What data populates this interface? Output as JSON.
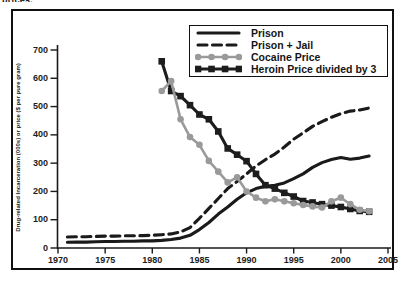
{
  "page": {
    "caption_fragment": "prices."
  },
  "chart_data": {
    "type": "line",
    "title": "",
    "xlabel": "",
    "ylabel": "Drug-related Incarceration (000s) or price ($ per pure gram)",
    "xlim": [
      1970,
      2005
    ],
    "ylim": [
      0,
      700
    ],
    "x_ticks": [
      1970,
      1975,
      1980,
      1985,
      1990,
      1995,
      2000,
      2005
    ],
    "y_ticks": [
      0,
      100,
      200,
      300,
      400,
      500,
      600,
      700
    ],
    "grid": false,
    "legend_position": "top-right",
    "axis_color": "#1a1a1a",
    "series": [
      {
        "name": "Prison",
        "style": "solid",
        "marker": "none",
        "color": "#1a1a1a",
        "points": [
          [
            1971,
            20
          ],
          [
            1972,
            21
          ],
          [
            1973,
            21
          ],
          [
            1974,
            22
          ],
          [
            1975,
            23
          ],
          [
            1976,
            23
          ],
          [
            1977,
            24
          ],
          [
            1978,
            24
          ],
          [
            1979,
            25
          ],
          [
            1980,
            25
          ],
          [
            1981,
            27
          ],
          [
            1982,
            30
          ],
          [
            1983,
            35
          ],
          [
            1984,
            45
          ],
          [
            1985,
            65
          ],
          [
            1986,
            90
          ],
          [
            1987,
            120
          ],
          [
            1988,
            145
          ],
          [
            1989,
            172
          ],
          [
            1990,
            195
          ],
          [
            1991,
            210
          ],
          [
            1992,
            218
          ],
          [
            1993,
            222
          ],
          [
            1994,
            230
          ],
          [
            1995,
            245
          ],
          [
            1996,
            262
          ],
          [
            1997,
            285
          ],
          [
            1998,
            302
          ],
          [
            1999,
            313
          ],
          [
            2000,
            320
          ],
          [
            2001,
            314
          ],
          [
            2002,
            318
          ],
          [
            2003,
            325
          ]
        ]
      },
      {
        "name": "Prison + Jail",
        "style": "dashed",
        "marker": "none",
        "color": "#1a1a1a",
        "points": [
          [
            1971,
            39
          ],
          [
            1972,
            40
          ],
          [
            1973,
            40
          ],
          [
            1974,
            41
          ],
          [
            1975,
            42
          ],
          [
            1976,
            42
          ],
          [
            1977,
            43
          ],
          [
            1978,
            43
          ],
          [
            1979,
            44
          ],
          [
            1980,
            45
          ],
          [
            1981,
            47
          ],
          [
            1982,
            50
          ],
          [
            1983,
            57
          ],
          [
            1984,
            72
          ],
          [
            1985,
            105
          ],
          [
            1986,
            140
          ],
          [
            1987,
            175
          ],
          [
            1988,
            210
          ],
          [
            1989,
            235
          ],
          [
            1990,
            262
          ],
          [
            1991,
            290
          ],
          [
            1992,
            312
          ],
          [
            1993,
            332
          ],
          [
            1994,
            357
          ],
          [
            1995,
            385
          ],
          [
            1996,
            407
          ],
          [
            1997,
            430
          ],
          [
            1998,
            447
          ],
          [
            1999,
            462
          ],
          [
            2000,
            475
          ],
          [
            2001,
            484
          ],
          [
            2002,
            488
          ],
          [
            2003,
            495
          ]
        ]
      },
      {
        "name": "Cocaine Price",
        "style": "solid",
        "marker": "circle",
        "color": "#9a9a9a",
        "points": [
          [
            1981,
            555
          ],
          [
            1982,
            590
          ],
          [
            1983,
            455
          ],
          [
            1984,
            392
          ],
          [
            1985,
            365
          ],
          [
            1986,
            308
          ],
          [
            1987,
            270
          ],
          [
            1988,
            232
          ],
          [
            1989,
            250
          ],
          [
            1990,
            200
          ],
          [
            1991,
            178
          ],
          [
            1992,
            165
          ],
          [
            1993,
            172
          ],
          [
            1994,
            165
          ],
          [
            1995,
            158
          ],
          [
            1996,
            152
          ],
          [
            1997,
            147
          ],
          [
            1998,
            143
          ],
          [
            1999,
            165
          ],
          [
            2000,
            178
          ],
          [
            2001,
            155
          ],
          [
            2002,
            135
          ],
          [
            2003,
            130
          ]
        ]
      },
      {
        "name": "Heroin Price divided by 3",
        "style": "solid",
        "marker": "square",
        "color": "#1d1d1d",
        "points": [
          [
            1981,
            660
          ],
          [
            1982,
            555
          ],
          [
            1983,
            537
          ],
          [
            1984,
            505
          ],
          [
            1985,
            472
          ],
          [
            1986,
            455
          ],
          [
            1987,
            412
          ],
          [
            1988,
            352
          ],
          [
            1989,
            330
          ],
          [
            1990,
            307
          ],
          [
            1991,
            262
          ],
          [
            1992,
            222
          ],
          [
            1993,
            210
          ],
          [
            1994,
            195
          ],
          [
            1995,
            182
          ],
          [
            1996,
            166
          ],
          [
            1997,
            161
          ],
          [
            1998,
            155
          ],
          [
            1999,
            150
          ],
          [
            2000,
            145
          ],
          [
            2001,
            138
          ],
          [
            2002,
            131
          ],
          [
            2003,
            128
          ]
        ]
      }
    ]
  }
}
